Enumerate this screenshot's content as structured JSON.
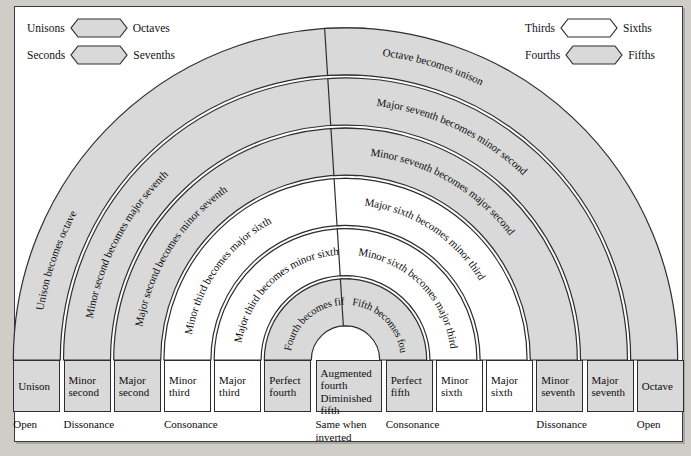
{
  "colors": {
    "page_background": "#cfcdc8",
    "panel_background": "#ffffff",
    "shaded_fill": "#d9d9d9",
    "unshaded_fill": "#ffffff",
    "stroke": "#2e2e2e",
    "text": "#0d0d0d"
  },
  "legend": {
    "left": [
      {
        "left_label": "Unisons",
        "right_label": "Octaves",
        "swatch": "gray",
        "swatch_shape": "hexagon"
      },
      {
        "left_label": "Seconds",
        "right_label": "Sevenths",
        "swatch": "gray",
        "swatch_shape": "hexagon"
      }
    ],
    "right": [
      {
        "left_label": "Thirds",
        "right_label": "Sixths",
        "swatch": "white",
        "swatch_shape": "hexagon"
      },
      {
        "left_label": "Fourths",
        "right_label": "Fifths",
        "swatch": "gray",
        "swatch_shape": "hexagon"
      }
    ]
  },
  "arcs": [
    {
      "index": 0,
      "left_text": "Unison becomes octave",
      "right_text": "Octave becomes unison",
      "fill": "gray"
    },
    {
      "index": 1,
      "left_text": "Minor second becomes major seventh",
      "right_text": "Major seventh becomes minor second",
      "fill": "gray"
    },
    {
      "index": 2,
      "left_text": "Major second becomes minor seventh",
      "right_text": "Minor seventh becomes major second",
      "fill": "gray"
    },
    {
      "index": 3,
      "left_text": "Minor third becomes major sixth",
      "right_text": "Major sixth becomes minor third",
      "fill": "white"
    },
    {
      "index": 4,
      "left_text": "Major third becomes minor sixth",
      "right_text": "Minor sixth becomes major third",
      "fill": "white"
    },
    {
      "index": 5,
      "left_text": "Fourth becomes fifth",
      "right_text": "Fifth becomes fourth",
      "fill": "gray"
    }
  ],
  "boxes": [
    {
      "line1": "Unison",
      "line2": "",
      "fill": "gray"
    },
    {
      "line1": "Minor",
      "line2": "second",
      "fill": "gray"
    },
    {
      "line1": "Major",
      "line2": "second",
      "fill": "gray"
    },
    {
      "line1": "Minor",
      "line2": "third",
      "fill": "white"
    },
    {
      "line1": "Major",
      "line2": "third",
      "fill": "white"
    },
    {
      "line1": "Perfect",
      "line2": "fourth",
      "fill": "gray"
    },
    {
      "line1": "Augmented",
      "line2": "fourth",
      "line3": "Diminished",
      "line4": "fifth",
      "fill": "gray",
      "wide": true
    },
    {
      "line1": "Perfect",
      "line2": "fifth",
      "fill": "gray"
    },
    {
      "line1": "Minor",
      "line2": "sixth",
      "fill": "white"
    },
    {
      "line1": "Major",
      "line2": "sixth",
      "fill": "white"
    },
    {
      "line1": "Minor",
      "line2": "seventh",
      "fill": "gray"
    },
    {
      "line1": "Major",
      "line2": "seventh",
      "fill": "gray"
    },
    {
      "line1": "Octave",
      "line2": "",
      "fill": "gray"
    }
  ],
  "categories": [
    {
      "label": "Open"
    },
    {
      "label": "Dissonance"
    },
    {
      "label": "Consonance"
    },
    {
      "label": "Same when\ninverted"
    },
    {
      "label": "Consonance"
    },
    {
      "label": "Dissonance"
    },
    {
      "label": "Open"
    }
  ]
}
